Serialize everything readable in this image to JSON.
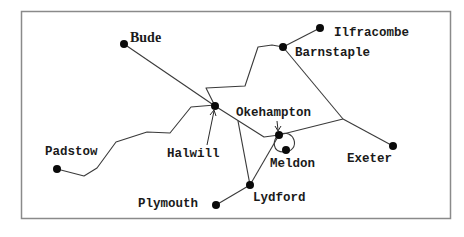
{
  "diagram": {
    "title": "",
    "type": "railway-network-map",
    "stations": [
      {
        "id": "bude",
        "label": "Bude"
      },
      {
        "id": "ilfracombe",
        "label": "Ilfracombe"
      },
      {
        "id": "barnstaple",
        "label": "Barnstaple"
      },
      {
        "id": "okehampton",
        "label": "Okehampton"
      },
      {
        "id": "halwill",
        "label": "Halwill"
      },
      {
        "id": "padstow",
        "label": "Padstow"
      },
      {
        "id": "meldon",
        "label": "Meldon"
      },
      {
        "id": "exeter",
        "label": "Exeter"
      },
      {
        "id": "plymouth",
        "label": "Plymouth"
      },
      {
        "id": "lydford",
        "label": "Lydford"
      }
    ],
    "connections": [
      [
        "Bude",
        "Halwill"
      ],
      [
        "Padstow",
        "Halwill"
      ],
      [
        "Halwill",
        "Barnstaple"
      ],
      [
        "Barnstaple",
        "Ilfracombe"
      ],
      [
        "Barnstaple",
        "Exeter"
      ],
      [
        "Halwill",
        "Okehampton"
      ],
      [
        "Halwill",
        "Lydford"
      ],
      [
        "Okehampton",
        "Exeter"
      ],
      [
        "Okehampton",
        "Meldon"
      ],
      [
        "Okehampton",
        "Lydford"
      ],
      [
        "Lydford",
        "Plymouth"
      ]
    ],
    "colors": {
      "line": "#3a3a3a",
      "station": "#0a0a0a",
      "frame": "#8a8a8a",
      "background": "#ffffff"
    }
  }
}
